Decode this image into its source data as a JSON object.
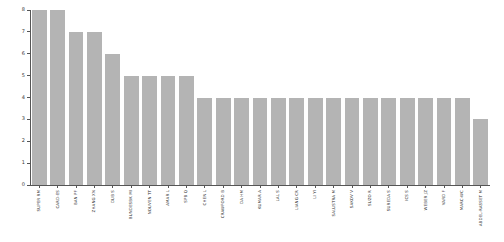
{
  "chart_data": {
    "type": "bar",
    "title": "",
    "xlabel": "",
    "ylabel": "",
    "ylim": [
      0,
      8
    ],
    "yticks": [
      0,
      1,
      2,
      3,
      4,
      5,
      6,
      7,
      8
    ],
    "grid": false,
    "legend": null,
    "bar_color": "#b4b4b4",
    "xtick_rotation": 90,
    "categories": [
      "SUPER RM",
      "CARD-ES",
      "BAN PF",
      "ZHANG XN",
      "DUB S",
      "BUNDESBK MI",
      "NOUVEN TT",
      "AMAR L",
      "SPB Q",
      "CHEN L",
      "CRAWFORD B",
      "DA HM",
      "KUMAR A",
      "LAL S",
      "LIANG CR",
      "LI YI",
      "SALUSTRA M",
      "SAKOV V",
      "SUZO R",
      "SUREDA S",
      "ICS S",
      "WEBER JZ",
      "VARD F",
      "MARC-WC",
      "ABDEL-RASSET M"
    ],
    "values": [
      8,
      8,
      7,
      7,
      6,
      5,
      5,
      5,
      5,
      4,
      4,
      4,
      4,
      4,
      4,
      4,
      4,
      4,
      4,
      4,
      4,
      4,
      4,
      4,
      3
    ]
  },
  "figure": {
    "background": "#ffffff",
    "axis_color": "#555555",
    "tick_label_color": "#333333"
  }
}
